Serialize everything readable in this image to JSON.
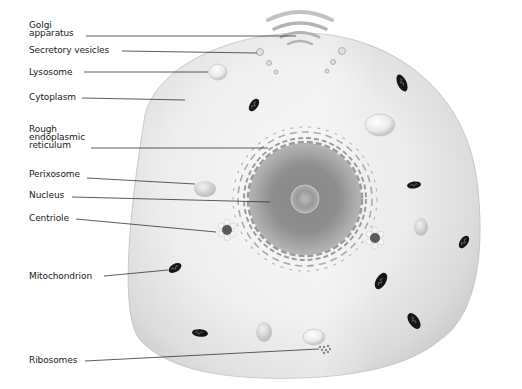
{
  "diagram": {
    "labels": {
      "golgi": "Golgi\napparatus",
      "secretory_vesicles": "Secretory vesicles",
      "lysosome": "Lysosome",
      "cytoplasm": "Cytoplasm",
      "rough_er": "Rough\nendoplasmic\nreticulum",
      "perixosome": "Perixosome",
      "nucleus": "Nucleus",
      "centriole": "Centriole",
      "mitochondrion": "Mitochondrion",
      "ribosomes": "Ribosomes"
    },
    "colors": {
      "cell_fill": "#e6e6e6",
      "cell_edge": "#c4c4c4",
      "nucleus_outer": "#9a9a9a",
      "nucleus_inner": "#7d7d7d",
      "mitochondrion": "#1a1a1a",
      "leader_line": "#333333",
      "text": "#1a1a1a"
    }
  }
}
